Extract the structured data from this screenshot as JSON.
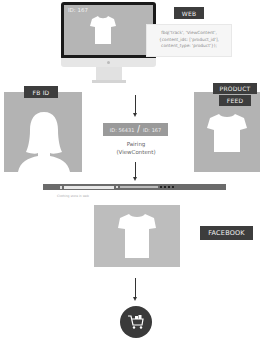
{
  "web": {
    "label": "WEB",
    "screen_id": "ID: 167",
    "code_lines": [
      "fbq('track', 'ViewContent',",
      "{content_ids: ['product_id'],",
      "content_type: 'product'});"
    ]
  },
  "fb_id": {
    "label": "FB ID"
  },
  "product_feed": {
    "label_line1": "PRODUCT",
    "label_line2": "FEED"
  },
  "pairing": {
    "left_id": "ID: 56431",
    "separator": "/",
    "right_id": "ID: 167",
    "text_line1": "Pairing",
    "text_line2": "(ViewContent)"
  },
  "facebook": {
    "label": "FACEBOOK",
    "post_caption": "Clothing store in web"
  },
  "colors": {
    "label_bg": "#3d3d3d",
    "panel_gray": "#b3b3b3",
    "cart_circle": "#3a3a3a"
  },
  "icons": [
    "tshirt-icon",
    "person-silhouette-icon",
    "shopping-cart-icon",
    "arrow-down-icon"
  ]
}
